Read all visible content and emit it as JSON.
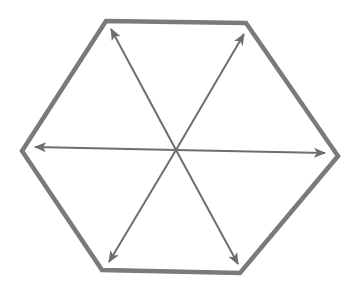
{
  "diagram": {
    "title": "",
    "colors": {
      "background": "#ffffff",
      "hexagon_stroke": "#7a7a7a",
      "arrow_stroke": "#6e6e6e"
    },
    "hexagon": {
      "vertices": [
        [
          106,
          21
        ],
        [
          246,
          23
        ],
        [
          338,
          156
        ],
        [
          240,
          273
        ],
        [
          102,
          270
        ],
        [
          22,
          151
        ]
      ],
      "stroke_width": 4.5
    },
    "center": [
      176,
      150
    ],
    "arrows": [
      {
        "id": "up-left",
        "tip": [
          111,
          29
        ],
        "bidirectional": false
      },
      {
        "id": "up-right",
        "tip": [
          244,
          34
        ],
        "bidirectional": false
      },
      {
        "id": "left",
        "tip": [
          35,
          147
        ],
        "bidirectional": false
      },
      {
        "id": "right",
        "tip": [
          325,
          153
        ],
        "bidirectional": false
      },
      {
        "id": "down-left",
        "tip": [
          109,
          262
        ],
        "bidirectional": false
      },
      {
        "id": "down-right",
        "tip": [
          238,
          264
        ],
        "bidirectional": false
      }
    ],
    "arrow_stroke_width": 2
  }
}
